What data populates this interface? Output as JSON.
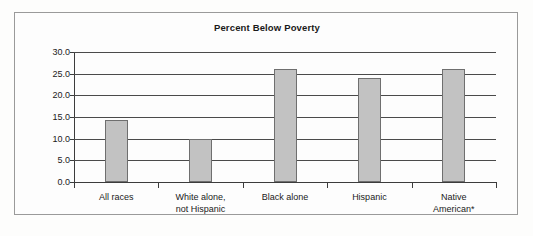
{
  "figure": {
    "title": "Percent Below Poverty",
    "frame_border_color": "#9a9a9a",
    "background_color": "#fdfdfd"
  },
  "chart_data": {
    "type": "bar",
    "title": "Percent Below Poverty",
    "xlabel": "",
    "ylabel": "",
    "categories": [
      "All races",
      "White alone,\nnot Hispanic",
      "Black alone",
      "Hispanic",
      "Native\nAmerican*"
    ],
    "values": [
      14.3,
      10.0,
      26.0,
      24.0,
      26.0
    ],
    "ylim": [
      0.0,
      30.0
    ],
    "yticks": [
      0.0,
      5.0,
      10.0,
      15.0,
      20.0,
      25.0,
      30.0
    ],
    "ytick_labels": [
      "0.0",
      "5.0",
      "10.0",
      "15.0",
      "20.0",
      "25.0",
      "30.0"
    ],
    "grid": true,
    "grid_axis": "y",
    "legend": false,
    "bar_fill_color": "#c2c2c2",
    "bar_edge_color": "#6f6f6f",
    "gridline_color": "#4a4a4a",
    "axis_color": "#3c3c3c"
  }
}
